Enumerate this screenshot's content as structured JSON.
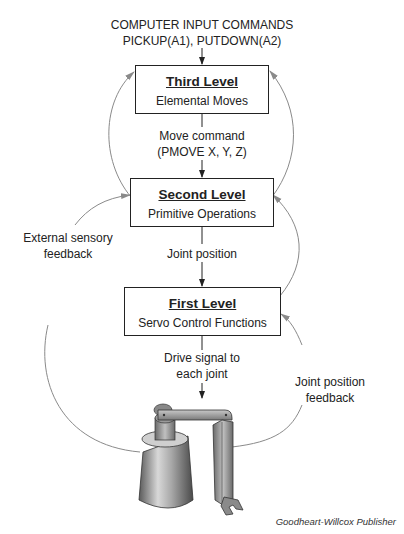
{
  "input": {
    "line1": "COMPUTER INPUT COMMANDS",
    "line2": "PICKUP(A1), PUTDOWN(A2)"
  },
  "levels": [
    {
      "title": "Third Level",
      "subtitle": "Elemental Moves"
    },
    {
      "title": "Second Level",
      "subtitle": "Primitive Operations"
    },
    {
      "title": "First Level",
      "subtitle": "Servo Control Functions"
    }
  ],
  "signals": {
    "move_command_line1": "Move command",
    "move_command_line2": "(PMOVE X, Y, Z)",
    "joint_position": "Joint position",
    "drive_signal_line1": "Drive signal to",
    "drive_signal_line2": "each joint"
  },
  "feedback": {
    "external_line1": "External sensory",
    "external_line2": "feedback",
    "joint_line1": "Joint position",
    "joint_line2": "feedback"
  },
  "illustration": "robot-arm",
  "credit": "Goodheart-Willcox Publisher",
  "colors": {
    "box_border": "#222222",
    "arrow_main": "#222222",
    "arc": "#8a8a8a",
    "text": "#222222"
  }
}
